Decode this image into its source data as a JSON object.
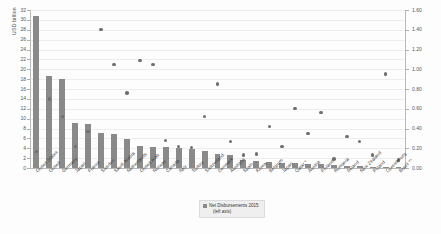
{
  "chart_data": {
    "type": "bar",
    "title": "",
    "ylabel": "USD billion",
    "xlabel": "",
    "ylim": [
      0,
      32
    ],
    "ylim_right": [
      0.0,
      1.6
    ],
    "grid": true,
    "legend_position": "bottom-center",
    "legend": [
      {
        "label": "Net Disbursements 2015",
        "sublabel": "(left axis)",
        "type": "bar",
        "color": "#8a8a8a"
      }
    ],
    "yticks_left": [
      "0",
      "2",
      "4",
      "6",
      "8",
      "10",
      "12",
      "14",
      "16",
      "18",
      "20",
      "22",
      "24",
      "26",
      "28",
      "30",
      "32"
    ],
    "yticks_right": [
      "0.00",
      "0.20",
      "0.40",
      "0.60",
      "0.80",
      "1.00",
      "1.20",
      "1.40",
      "1.60"
    ],
    "categories": [
      "United States",
      "United",
      "Germany",
      "Japan",
      "France",
      "Sweden",
      "Saudi Arabia",
      "Netherlands",
      "United Arab",
      "Norway",
      "Canada",
      "Italy",
      "Turkey",
      "Switzerland",
      "Denmark",
      "Australia",
      "Spain",
      "Korea",
      "Belgium",
      "Japan",
      "Qatar *",
      "Austria",
      "Finland",
      "Romania",
      "Ireland",
      "New Zealand",
      "Poland",
      "Luxembourg",
      "Brazil **"
    ],
    "series": [
      {
        "name": "Net Disbursements 2015",
        "axis": "left",
        "type": "bar",
        "color": "#8a8a8a",
        "values": [
          30.8,
          18.6,
          18.0,
          9.2,
          9.0,
          7.1,
          6.9,
          5.9,
          4.4,
          4.3,
          4.3,
          4.0,
          3.9,
          3.5,
          2.8,
          2.7,
          1.6,
          1.4,
          1.2,
          1.1,
          1.0,
          0.9,
          0.8,
          0.6,
          0.5,
          0.4,
          0.3,
          0.3,
          0.2
        ]
      },
      {
        "name": "ODA as share of GNI",
        "axis": "right",
        "type": "scatter",
        "color": "#6f6f6f",
        "values": [
          0.17,
          0.7,
          0.52,
          0.22,
          0.37,
          1.4,
          1.05,
          0.76,
          1.09,
          1.05,
          0.28,
          0.22,
          0.21,
          0.52,
          0.85,
          0.27,
          0.13,
          0.14,
          0.42,
          0.22,
          0.6,
          0.35,
          0.56,
          0.09,
          0.32,
          0.27,
          0.13,
          0.95,
          0.08
        ]
      }
    ]
  }
}
